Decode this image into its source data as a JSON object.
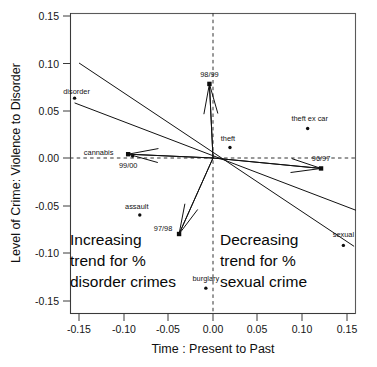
{
  "chart_data": {
    "type": "scatter",
    "title": "",
    "xlabel": "Time : Present to Past",
    "ylabel": "Level of Crime: Violence to Disorder",
    "xlim": [
      -0.175,
      0.168
    ],
    "ylim": [
      -0.172,
      0.165
    ],
    "xticks": [
      "-0.15",
      "-0.10",
      "-0.05",
      "0.00",
      "0.05",
      "0.10",
      "0.15"
    ],
    "xtick_values": [
      -0.15,
      -0.1,
      -0.05,
      0.0,
      0.05,
      0.1,
      0.15
    ],
    "yticks": [
      "0.15",
      "0.10",
      "0.05",
      "0.00",
      "-0.05",
      "-0.10",
      "-0.15"
    ],
    "ytick_values": [
      0.15,
      0.1,
      0.05,
      0.0,
      -0.05,
      -0.1,
      -0.15
    ],
    "grid": false,
    "legend": "none",
    "reference_lines": [
      {
        "name": "horizontal-zero",
        "orientation": "horizontal",
        "value": 0.0,
        "style": "dashed"
      },
      {
        "name": "vertical-zero",
        "orientation": "vertical",
        "value": 0.0,
        "style": "dashed"
      }
    ],
    "crime_points": [
      {
        "label": "disorder",
        "x": -0.155,
        "y": 0.063,
        "marker": "dot",
        "label_dx": 2,
        "label_dy": -4
      },
      {
        "label": "cannabis",
        "x": -0.09,
        "y": 0.002,
        "marker": "dot",
        "label_dx": -34,
        "label_dy": -1
      },
      {
        "label": "assault",
        "x": -0.082,
        "y": -0.06,
        "marker": "dot",
        "label_dx": -3,
        "label_dy": -6
      },
      {
        "label": "theft",
        "x": 0.019,
        "y": 0.011,
        "marker": "dot",
        "label_dx": -2,
        "label_dy": -7
      },
      {
        "label": "theft ex car",
        "x": 0.106,
        "y": 0.031,
        "marker": "dot",
        "label_dx": 2,
        "label_dy": -8
      },
      {
        "label": "sexual",
        "x": 0.146,
        "y": -0.092,
        "marker": "dot",
        "label_dx": 0,
        "label_dy": -8
      },
      {
        "label": "burglary",
        "x": -0.008,
        "y": -0.137,
        "marker": "dot",
        "label_dx": 0,
        "label_dy": -7
      }
    ],
    "year_vectors": [
      {
        "label": "98/99",
        "x": -0.004,
        "y": 0.078,
        "marker": "square",
        "label_dx": 0,
        "label_dy": -7
      },
      {
        "label": "99/00",
        "x": -0.095,
        "y": 0.004,
        "marker": "square",
        "label_dx": 0,
        "label_dy": 14
      },
      {
        "label": "97/98",
        "x": -0.038,
        "y": -0.08,
        "marker": "square",
        "label_dx": -16,
        "label_dy": -3
      },
      {
        "label": "96/97",
        "x": 0.121,
        "y": -0.011,
        "marker": "square",
        "label_dx": 0,
        "label_dy": -7
      }
    ],
    "trend_lines": [
      {
        "name": "upper-trend",
        "x1": -0.15,
        "y1": 0.1,
        "x2": 0.158,
        "y2": -0.093
      },
      {
        "name": "lower-trend",
        "x1": -0.155,
        "y1": 0.058,
        "x2": 0.16,
        "y2": -0.055
      }
    ],
    "annotations": [
      {
        "name": "increasing-disorder-annotation",
        "lines": [
          "Increasing",
          "trend for %",
          "disorder crimes"
        ],
        "x": -0.157,
        "y": -0.085
      },
      {
        "name": "decreasing-sexual-annotation",
        "lines": [
          "Decreasing",
          "trend for %",
          "sexual crime"
        ],
        "x": 0.008,
        "y": -0.085
      }
    ]
  },
  "axes": {
    "x_title": "Time : Present to Past",
    "y_title": "Level of Crime: Violence to Disorder",
    "x_tick_labels": [
      "-0.15",
      "-0.10",
      "-0.05",
      "0.00",
      "0.05",
      "0.10",
      "0.15"
    ],
    "y_tick_labels": [
      "0.15",
      "0.10",
      "0.05",
      "0.00",
      "-0.05",
      "-0.10",
      "-0.15"
    ]
  },
  "labels": {
    "disorder": "disorder",
    "cannabis": "cannabis",
    "assault": "assault",
    "theft": "theft",
    "theft_ex_car": "theft ex car",
    "sexual": "sexual",
    "burglary": "burglary",
    "y9899": "98/99",
    "y9900": "99/00",
    "y9798": "97/98",
    "y9697": "96/97"
  },
  "annotation_text": {
    "left_line1": "Increasing",
    "left_line2": "trend for %",
    "left_line3": "disorder crimes",
    "right_line1": "Decreasing",
    "right_line2": "trend for %",
    "right_line3": "sexual crime"
  },
  "colors": {
    "ink": "#111111",
    "frame": "#5a5a5a",
    "background": "#ffffff"
  }
}
